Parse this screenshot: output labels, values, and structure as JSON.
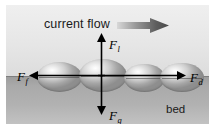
{
  "figure": {
    "type": "force-balance-diagram",
    "background_color": "#ffffff",
    "panel_color": "#e9e9e9"
  },
  "flow": {
    "label": "current flow",
    "arrow_direction": "right",
    "arrow_gradient_from": "#d2d2d2",
    "arrow_gradient_to": "#555555"
  },
  "regions": {
    "water_label": "",
    "bed_label": "bed",
    "bed_color": "#a9a9a9",
    "water_color": "#e6e6e6"
  },
  "grains": {
    "count": 4,
    "shape": "ellipse",
    "items": [
      {
        "name": "grain-1"
      },
      {
        "name": "grain-2"
      },
      {
        "name": "grain-3"
      },
      {
        "name": "grain-4"
      }
    ]
  },
  "forces": [
    {
      "id": "lift",
      "symbol": "F",
      "subscript": "l",
      "label": "F_l",
      "direction": "up",
      "description": "lift force"
    },
    {
      "id": "gravity",
      "symbol": "F",
      "subscript": "g",
      "label": "F_g",
      "direction": "down",
      "description": "gravitational force"
    },
    {
      "id": "friction",
      "symbol": "F",
      "subscript": "f",
      "label": "F_f",
      "direction": "left",
      "description": "frictional resisting force"
    },
    {
      "id": "drag",
      "symbol": "F",
      "subscript": "d",
      "label": "F_d",
      "direction": "right",
      "description": "drag force"
    }
  ]
}
